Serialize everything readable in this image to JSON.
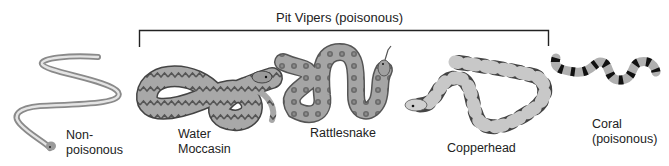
{
  "diagram": {
    "group_label": "Pit Vipers (poisonous)",
    "group_bracket": {
      "x_start": 139,
      "x_end": 548,
      "y": 30,
      "drop_to": 47
    },
    "snakes": [
      {
        "id": "non-poisonous",
        "label_line1": "Non-",
        "label_line2": "poisonous",
        "group": "none",
        "pattern": "plain-striped"
      },
      {
        "id": "water-moccasin",
        "label_line1": "Water",
        "label_line2": "Moccasin",
        "group": "pit-vipers",
        "pattern": "zigzag-bands"
      },
      {
        "id": "rattlesnake",
        "label_line1": "Rattlesnake",
        "group": "pit-vipers",
        "pattern": "diamond-blotches"
      },
      {
        "id": "copperhead",
        "label_line1": "Copperhead",
        "group": "pit-vipers",
        "pattern": "hourglass-bands"
      },
      {
        "id": "coral",
        "label_line1": "Coral",
        "label_line2": "(poisonous)",
        "group": "none",
        "pattern": "black-rings"
      }
    ],
    "colors": {
      "body_light": "#bdbdbd",
      "body_mid": "#9a9a9a",
      "band_dark": "#4a4a4a",
      "ring_black": "#111111",
      "bracket": "#222222"
    }
  }
}
